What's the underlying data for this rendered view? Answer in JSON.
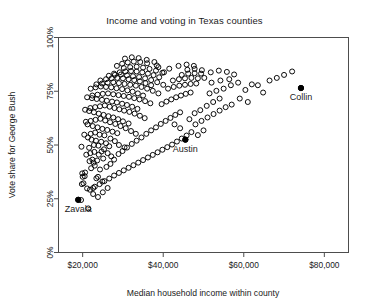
{
  "chart_data": {
    "type": "scatter",
    "title": "Income and voting in Texas counties",
    "xlabel": "Median household income within county",
    "ylabel": "Vote share for George Bush",
    "xlim": [
      14000,
      86000
    ],
    "ylim": [
      0,
      1
    ],
    "grid": false,
    "legend": null,
    "xticks": [
      20000,
      40000,
      60000,
      80000
    ],
    "xticklabels": [
      "$20,000",
      "$40,000",
      "$60,000",
      "$80,000"
    ],
    "yticks": [
      0,
      0.25,
      0.5,
      0.75,
      1.0
    ],
    "yticklabels": [
      "0%",
      "25%",
      "50%",
      "75%",
      "100%"
    ],
    "marker": "open-circle",
    "annotations": [
      {
        "label": "Zavala",
        "x": 18900,
        "y": 0.245,
        "filled": true
      },
      {
        "label": "Austin",
        "x": 45500,
        "y": 0.525,
        "filled": true
      },
      {
        "label": "Collin",
        "x": 74200,
        "y": 0.765,
        "filled": true
      }
    ],
    "points": [
      [
        18900,
        0.245
      ],
      [
        19600,
        0.244
      ],
      [
        21400,
        0.205
      ],
      [
        19800,
        0.318
      ],
      [
        20200,
        0.322
      ],
      [
        20000,
        0.352
      ],
      [
        20500,
        0.355
      ],
      [
        19900,
        0.368
      ],
      [
        20600,
        0.372
      ],
      [
        21100,
        0.298
      ],
      [
        22600,
        0.3
      ],
      [
        23400,
        0.345
      ],
      [
        22100,
        0.392
      ],
      [
        23000,
        0.404
      ],
      [
        24300,
        0.386
      ],
      [
        21700,
        0.425
      ],
      [
        22400,
        0.432
      ],
      [
        23600,
        0.428
      ],
      [
        20900,
        0.455
      ],
      [
        21900,
        0.462
      ],
      [
        22900,
        0.468
      ],
      [
        24000,
        0.455
      ],
      [
        25100,
        0.437
      ],
      [
        24700,
        0.47
      ],
      [
        19700,
        0.492
      ],
      [
        21600,
        0.487
      ],
      [
        22800,
        0.5
      ],
      [
        23900,
        0.497
      ],
      [
        25300,
        0.48
      ],
      [
        26200,
        0.462
      ],
      [
        27100,
        0.447
      ],
      [
        26600,
        0.494
      ],
      [
        25800,
        0.508
      ],
      [
        24600,
        0.515
      ],
      [
        23300,
        0.52
      ],
      [
        22200,
        0.525
      ],
      [
        21300,
        0.535
      ],
      [
        20400,
        0.548
      ],
      [
        22000,
        0.552
      ],
      [
        23100,
        0.558
      ],
      [
        24200,
        0.548
      ],
      [
        25400,
        0.545
      ],
      [
        26900,
        0.53
      ],
      [
        28000,
        0.518
      ],
      [
        29000,
        0.5
      ],
      [
        30400,
        0.489
      ],
      [
        28600,
        0.555
      ],
      [
        27400,
        0.562
      ],
      [
        26100,
        0.57
      ],
      [
        24900,
        0.575
      ],
      [
        23700,
        0.582
      ],
      [
        22500,
        0.588
      ],
      [
        21200,
        0.596
      ],
      [
        20800,
        0.608
      ],
      [
        22000,
        0.612
      ],
      [
        23200,
        0.617
      ],
      [
        24400,
        0.622
      ],
      [
        25600,
        0.614
      ],
      [
        26800,
        0.606
      ],
      [
        28100,
        0.598
      ],
      [
        29400,
        0.588
      ],
      [
        30700,
        0.578
      ],
      [
        32000,
        0.565
      ],
      [
        33200,
        0.552
      ],
      [
        31400,
        0.6
      ],
      [
        30000,
        0.61
      ],
      [
        28800,
        0.62
      ],
      [
        27600,
        0.628
      ],
      [
        26400,
        0.634
      ],
      [
        25200,
        0.64
      ],
      [
        24000,
        0.646
      ],
      [
        22800,
        0.652
      ],
      [
        21600,
        0.658
      ],
      [
        20600,
        0.664
      ],
      [
        21900,
        0.672
      ],
      [
        23100,
        0.676
      ],
      [
        24300,
        0.68
      ],
      [
        25500,
        0.684
      ],
      [
        26700,
        0.678
      ],
      [
        27900,
        0.672
      ],
      [
        29100,
        0.666
      ],
      [
        30300,
        0.66
      ],
      [
        31600,
        0.654
      ],
      [
        32900,
        0.646
      ],
      [
        34200,
        0.636
      ],
      [
        35400,
        0.625
      ],
      [
        33600,
        0.668
      ],
      [
        32300,
        0.678
      ],
      [
        31000,
        0.686
      ],
      [
        29800,
        0.692
      ],
      [
        28500,
        0.698
      ],
      [
        27300,
        0.702
      ],
      [
        26000,
        0.706
      ],
      [
        24800,
        0.71
      ],
      [
        23500,
        0.714
      ],
      [
        22300,
        0.718
      ],
      [
        21100,
        0.722
      ],
      [
        22400,
        0.73
      ],
      [
        23700,
        0.734
      ],
      [
        25000,
        0.738
      ],
      [
        26300,
        0.74
      ],
      [
        27600,
        0.736
      ],
      [
        28900,
        0.732
      ],
      [
        30200,
        0.728
      ],
      [
        31500,
        0.724
      ],
      [
        32800,
        0.718
      ],
      [
        34100,
        0.712
      ],
      [
        35500,
        0.704
      ],
      [
        36800,
        0.694
      ],
      [
        35000,
        0.73
      ],
      [
        33700,
        0.74
      ],
      [
        32400,
        0.748
      ],
      [
        31100,
        0.754
      ],
      [
        29800,
        0.76
      ],
      [
        28400,
        0.764
      ],
      [
        27100,
        0.768
      ],
      [
        25800,
        0.77
      ],
      [
        24500,
        0.772
      ],
      [
        23200,
        0.768
      ],
      [
        22000,
        0.762
      ],
      [
        23400,
        0.782
      ],
      [
        24800,
        0.786
      ],
      [
        26200,
        0.79
      ],
      [
        27600,
        0.792
      ],
      [
        29000,
        0.788
      ],
      [
        30400,
        0.784
      ],
      [
        31800,
        0.78
      ],
      [
        33200,
        0.776
      ],
      [
        34600,
        0.77
      ],
      [
        36000,
        0.762
      ],
      [
        37400,
        0.752
      ],
      [
        38800,
        0.74
      ],
      [
        37000,
        0.778
      ],
      [
        35600,
        0.788
      ],
      [
        34200,
        0.796
      ],
      [
        32800,
        0.802
      ],
      [
        31400,
        0.806
      ],
      [
        30000,
        0.81
      ],
      [
        28600,
        0.812
      ],
      [
        27200,
        0.81
      ],
      [
        25800,
        0.806
      ],
      [
        24400,
        0.8
      ],
      [
        26500,
        0.822
      ],
      [
        28000,
        0.826
      ],
      [
        29500,
        0.828
      ],
      [
        31000,
        0.824
      ],
      [
        32500,
        0.82
      ],
      [
        34000,
        0.816
      ],
      [
        35500,
        0.81
      ],
      [
        37000,
        0.802
      ],
      [
        38500,
        0.792
      ],
      [
        40000,
        0.78
      ],
      [
        39000,
        0.815
      ],
      [
        37600,
        0.825
      ],
      [
        36200,
        0.832
      ],
      [
        34800,
        0.838
      ],
      [
        33400,
        0.842
      ],
      [
        32000,
        0.844
      ],
      [
        30600,
        0.842
      ],
      [
        29200,
        0.838
      ],
      [
        27800,
        0.832
      ],
      [
        30200,
        0.858
      ],
      [
        31800,
        0.862
      ],
      [
        33400,
        0.864
      ],
      [
        35000,
        0.86
      ],
      [
        36600,
        0.854
      ],
      [
        38200,
        0.846
      ],
      [
        39800,
        0.836
      ],
      [
        28500,
        0.868
      ],
      [
        29800,
        0.878
      ],
      [
        31200,
        0.884
      ],
      [
        32700,
        0.888
      ],
      [
        34300,
        0.886
      ],
      [
        36000,
        0.88
      ],
      [
        30500,
        0.902
      ],
      [
        32200,
        0.908
      ],
      [
        33900,
        0.904
      ],
      [
        35900,
        0.896
      ],
      [
        37800,
        0.886
      ],
      [
        38400,
        0.87
      ],
      [
        22700,
        0.418
      ],
      [
        23800,
        0.352
      ],
      [
        24900,
        0.33
      ],
      [
        25900,
        0.398
      ],
      [
        26900,
        0.412
      ],
      [
        27800,
        0.432
      ],
      [
        28900,
        0.458
      ],
      [
        29900,
        0.472
      ],
      [
        31000,
        0.488
      ],
      [
        32200,
        0.505
      ],
      [
        33400,
        0.52
      ],
      [
        34600,
        0.535
      ],
      [
        35800,
        0.552
      ],
      [
        37000,
        0.568
      ],
      [
        38200,
        0.582
      ],
      [
        39400,
        0.598
      ],
      [
        40600,
        0.612
      ],
      [
        41800,
        0.626
      ],
      [
        43000,
        0.64
      ],
      [
        44200,
        0.652
      ],
      [
        39600,
        0.69
      ],
      [
        40800,
        0.702
      ],
      [
        42000,
        0.712
      ],
      [
        43200,
        0.722
      ],
      [
        44400,
        0.73
      ],
      [
        45600,
        0.738
      ],
      [
        46800,
        0.744
      ],
      [
        41200,
        0.762
      ],
      [
        42600,
        0.77
      ],
      [
        44000,
        0.776
      ],
      [
        45400,
        0.78
      ],
      [
        46800,
        0.784
      ],
      [
        48200,
        0.786
      ],
      [
        42400,
        0.8
      ],
      [
        43900,
        0.806
      ],
      [
        45400,
        0.81
      ],
      [
        47000,
        0.812
      ],
      [
        48600,
        0.81
      ],
      [
        44600,
        0.826
      ],
      [
        46200,
        0.832
      ],
      [
        47800,
        0.834
      ],
      [
        49400,
        0.832
      ],
      [
        46000,
        0.85
      ],
      [
        47800,
        0.854
      ],
      [
        49600,
        0.848
      ],
      [
        43800,
        0.868
      ],
      [
        45800,
        0.874
      ],
      [
        47600,
        0.868
      ],
      [
        41500,
        0.855
      ],
      [
        40200,
        0.838
      ],
      [
        38800,
        0.862
      ],
      [
        45500,
        0.525
      ],
      [
        44200,
        0.578
      ],
      [
        42800,
        0.596
      ],
      [
        46500,
        0.62
      ],
      [
        47800,
        0.648
      ],
      [
        49200,
        0.662
      ],
      [
        50800,
        0.682
      ],
      [
        52400,
        0.7
      ],
      [
        54000,
        0.716
      ],
      [
        51500,
        0.74
      ],
      [
        53200,
        0.752
      ],
      [
        55000,
        0.762
      ],
      [
        52000,
        0.79
      ],
      [
        54200,
        0.8
      ],
      [
        56400,
        0.806
      ],
      [
        50200,
        0.812
      ],
      [
        51800,
        0.838
      ],
      [
        53800,
        0.846
      ],
      [
        55800,
        0.84
      ],
      [
        57600,
        0.828
      ],
      [
        56800,
        0.778
      ],
      [
        58600,
        0.79
      ],
      [
        60400,
        0.756
      ],
      [
        62000,
        0.782
      ],
      [
        63500,
        0.778
      ],
      [
        64800,
        0.744
      ],
      [
        66400,
        0.8
      ],
      [
        68200,
        0.812
      ],
      [
        70000,
        0.826
      ],
      [
        74200,
        0.765
      ],
      [
        72000,
        0.842
      ],
      [
        59000,
        0.716
      ],
      [
        61000,
        0.7
      ],
      [
        57000,
        0.688
      ],
      [
        55500,
        0.676
      ],
      [
        54000,
        0.66
      ],
      [
        52500,
        0.644
      ],
      [
        51000,
        0.628
      ],
      [
        49500,
        0.612
      ],
      [
        48000,
        0.596
      ],
      [
        50000,
        0.568
      ],
      [
        48600,
        0.546
      ],
      [
        47000,
        0.56
      ],
      [
        45800,
        0.544
      ],
      [
        44600,
        0.53
      ],
      [
        43400,
        0.516
      ],
      [
        42200,
        0.502
      ],
      [
        41000,
        0.49
      ],
      [
        39800,
        0.478
      ],
      [
        38600,
        0.466
      ],
      [
        37400,
        0.454
      ],
      [
        36200,
        0.442
      ],
      [
        35000,
        0.43
      ],
      [
        33800,
        0.418
      ],
      [
        32600,
        0.406
      ],
      [
        31400,
        0.394
      ],
      [
        30200,
        0.382
      ],
      [
        29000,
        0.37
      ],
      [
        27800,
        0.358
      ],
      [
        26600,
        0.344
      ],
      [
        25400,
        0.332
      ],
      [
        24200,
        0.318
      ],
      [
        23000,
        0.306
      ],
      [
        21800,
        0.292
      ],
      [
        22600,
        0.272
      ],
      [
        23800,
        0.258
      ],
      [
        25000,
        0.28
      ],
      [
        26200,
        0.3
      ]
    ]
  }
}
